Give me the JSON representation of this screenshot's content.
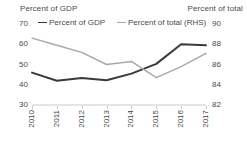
{
  "chart_data": {
    "type": "line",
    "title": "",
    "subtitle": "",
    "xlabel": "",
    "ylabel": "Percent of GDP",
    "y2label": "Percent of total",
    "categories": [
      "2010",
      "2011",
      "2012",
      "2013",
      "2014",
      "2015",
      "2016",
      "2017"
    ],
    "x_tick_labels": [
      "2010",
      "2011",
      "2012",
      "2013",
      "2014",
      "2015",
      "2016",
      "2017"
    ],
    "y_tick_labels": [
      "30",
      "40",
      "50",
      "60",
      "70"
    ],
    "y2_tick_labels": [
      "82",
      "84",
      "86",
      "88",
      "90"
    ],
    "ylim": [
      30,
      70
    ],
    "y2lim": [
      82,
      90
    ],
    "grid": false,
    "legend_position": "top",
    "series": [
      {
        "name": "Percent of GDP",
        "axis": "left",
        "color": "#3a3a3a",
        "values": [
          46.0,
          42.0,
          43.3,
          42.2,
          45.5,
          50.3,
          60.0,
          59.5
        ]
      },
      {
        "name": "Percent of total (RHS)",
        "axis": "right",
        "color": "#a8a8a8",
        "values": [
          88.6,
          87.9,
          87.2,
          86.0,
          86.3,
          84.7,
          85.8,
          87.1
        ]
      }
    ],
    "legend": [
      {
        "label": "Percent of GDP",
        "color": "#3a3a3a"
      },
      {
        "label": "Percent of total (RHS)",
        "color": "#a8a8a8"
      }
    ]
  },
  "axis_titles": {
    "left": "Percent of GDP",
    "right": "Percent of total"
  },
  "colors": {
    "series_gdp": "#3a3a3a",
    "series_total": "#a8a8a8",
    "axis_line": "#c9c9c9",
    "text": "#4a4a4a",
    "background": "#ffffff"
  }
}
